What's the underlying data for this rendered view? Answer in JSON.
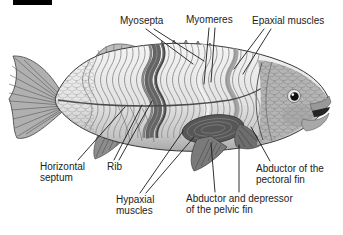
{
  "figure": {
    "marker_color": "#000000",
    "background": "#ffffff"
  },
  "colors": {
    "label_text": "#1c1c1c",
    "leader_line": "#1a1a1a",
    "body_light": "#f2f2f2",
    "body_shadow": "#a8a8a8",
    "fin_gray": "#b8b8b8",
    "dark_muscle": "#575757",
    "outline": "#383838"
  },
  "annotations": [
    {
      "id": "myosepta",
      "text": "Myosepta",
      "lines": [
        [
          146,
          29,
          193,
          64
        ],
        [
          154,
          29,
          204,
          61
        ]
      ]
    },
    {
      "id": "myomeres",
      "text": "Myomeres",
      "lines": [
        [
          209,
          28,
          204,
          84
        ],
        [
          215,
          28,
          211,
          82
        ]
      ]
    },
    {
      "id": "epaxial",
      "text": "Epaxial muscles",
      "lines": [
        [
          264,
          29,
          234,
          69
        ],
        [
          271,
          29,
          243,
          74
        ]
      ]
    },
    {
      "id": "hseptum",
      "text": "Horizontal septum",
      "lines": [
        [
          78,
          160,
          125,
          107
        ]
      ]
    },
    {
      "id": "rib",
      "text": "Rib",
      "lines": [
        [
          114,
          160,
          142,
          105
        ],
        [
          119,
          160,
          152,
          101
        ]
      ]
    },
    {
      "id": "hypaxial",
      "text": "Hypaxial muscles",
      "lines": [
        [
          140,
          193,
          183,
          131
        ],
        [
          146,
          193,
          194,
          137
        ]
      ]
    },
    {
      "id": "pelvic",
      "text": "Abductor and depressor of the pelvic fin",
      "lines": [
        [
          215,
          192,
          211,
          143
        ],
        [
          239,
          192,
          239,
          145
        ]
      ]
    },
    {
      "id": "pectoral",
      "text": "Abductor of the pectoral fin",
      "lines": [
        [
          270,
          161,
          251,
          127
        ]
      ]
    }
  ]
}
